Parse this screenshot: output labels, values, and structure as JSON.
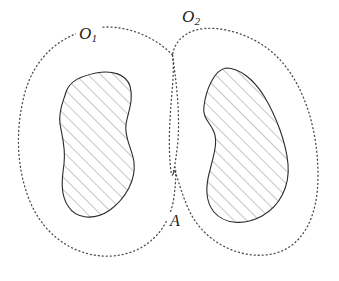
{
  "figure": {
    "kind": "topology-diagram",
    "caption_present": false,
    "background_color": "#ffffff",
    "width": 339,
    "height": 281
  },
  "labels": {
    "open_set_1": {
      "base": "O",
      "subscript": "1",
      "full": "O1"
    },
    "open_set_2": {
      "base": "O",
      "subscript": "2",
      "full": "O2"
    },
    "point_a": {
      "base": "A",
      "full": "A"
    }
  },
  "style": {
    "dotted_boundary_color": "#4a4a4a",
    "solid_outline_color": "#2b2b2b",
    "hatch_color": "#6f6f6f",
    "label_color": "#1c1c1c",
    "dotted_dash_pattern": "1 3",
    "dotted_stroke_width": 1.3,
    "outline_stroke_width": 1.1,
    "hatch_stroke_width": 0.8,
    "hatch_angle_degrees": 45,
    "hatch_spacing_px": 9
  },
  "geometry": {
    "open_set_1_path": "M 172.5,55 C 150,32 118,24 96,28 C 62,34 34,56 24,96 C 14,136 18,176 32,206 C 48,240 80,258 112,256 C 144,254 168,232 173.5,200 C 177,178 176,158 173.5,172 C 171,186 168,150 170,120 C 171,96 175,72 172.5,55 Z",
    "open_set_2_path": "M 172.5,55 C 176,80 180,110 178,140 C 176,162 172,180 173.5,172 C 175,164 180,194 192,216 C 208,244 242,260 272,254 C 302,248 318,218 318,176 C 318,132 306,90 282,62 C 258,34 218,24 196,30 C 182,34 174,44 172.5,55 Z",
    "blob_left_path": "M 96,73 C 112,70 126,74 130,86 C 134,100 128,112 126,124 C 124,138 132,148 134,162 C 136,180 126,198 110,210 C 94,221 76,219 68,206 C 60,194 62,178 64,164 C 66,148 62,136 60,124 C 58,110 64,100 66,92 C 70,80 82,76 96,73 Z",
    "blob_right_path": "M 226,68 C 240,68 254,80 264,96 C 276,116 286,142 288,164 C 290,186 280,206 262,216 C 244,226 224,224 214,212 C 204,200 206,184 210,170 C 214,154 218,142 214,132 C 210,122 202,118 204,106 C 206,90 214,70 226,68 Z",
    "crossing_points": [
      {
        "name": "upper-pinch",
        "x": 172.5,
        "y": 55
      },
      {
        "name": "lower-pinch-A",
        "x": 173.5,
        "y": 172
      }
    ]
  }
}
